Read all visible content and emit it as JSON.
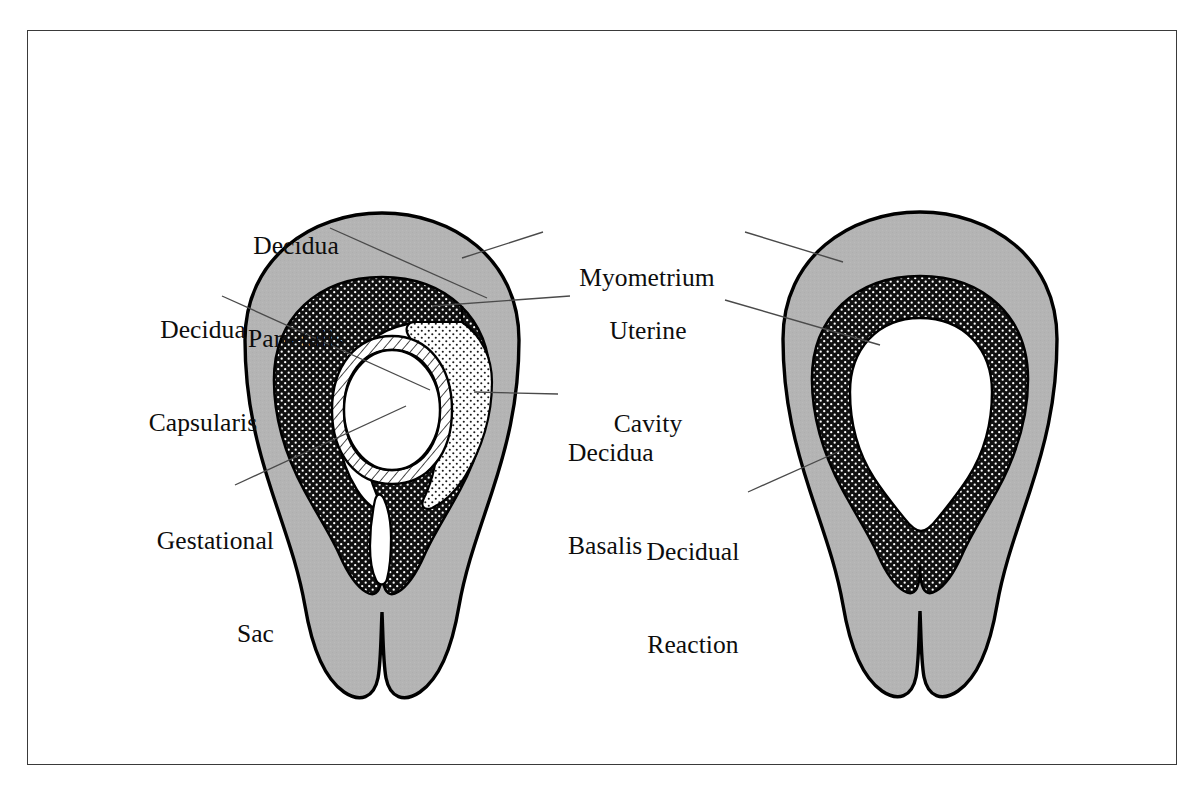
{
  "figure": {
    "frame": {
      "border_color": "#3a3a3a",
      "background": "#ffffff"
    }
  },
  "palette": {
    "myometrium_gray": "#b4b4b4",
    "decidua_black": "#101010",
    "cavity_white": "#ffffff",
    "outline_black": "#000000",
    "leader_line": "#4a4a4a",
    "text_black": "#0d0d0d"
  },
  "labels": [
    {
      "id": "decidua-parietalis",
      "lines": [
        "Decidua",
        "Parietalis"
      ],
      "align": "center",
      "x": 206,
      "y": 168,
      "width": 180,
      "leader": [
        [
          330,
          228
        ],
        [
          487,
          298
        ]
      ]
    },
    {
      "id": "decidua-capsularis",
      "lines": [
        "Decidua",
        "Capsularis"
      ],
      "align": "center",
      "x": 108,
      "y": 252,
      "width": 190,
      "leader": [
        [
          222,
          296
        ],
        [
          430,
          390
        ]
      ]
    },
    {
      "id": "gestational-sac",
      "lines": [
        "Gestational",
        "Sac"
      ],
      "align": "right",
      "x": 92,
      "y": 463,
      "width": 182,
      "leader": [
        [
          235,
          485
        ],
        [
          406,
          406
        ]
      ]
    },
    {
      "id": "myometrium",
      "lines": [
        "Myometrium"
      ],
      "align": "center",
      "x": 553,
      "y": 200,
      "width": 188,
      "leader_left": [
        [
          543,
          232
        ],
        [
          462,
          258
        ]
      ],
      "leader_right": [
        [
          745,
          232
        ],
        [
          843,
          262
        ]
      ]
    },
    {
      "id": "uterine-cavity",
      "lines": [
        "Uterine",
        "Cavity"
      ],
      "align": "center",
      "x": 576,
      "y": 253,
      "width": 144,
      "leader_left": [
        [
          570,
          296
        ],
        [
          432,
          306
        ]
      ],
      "leader_right": [
        [
          725,
          300
        ],
        [
          880,
          345
        ]
      ]
    },
    {
      "id": "decidua-basalis",
      "lines": [
        "Decidua",
        "Basalis"
      ],
      "align": "left",
      "x": 568,
      "y": 375,
      "width": 180,
      "leader": [
        [
          558,
          394
        ],
        [
          474,
          392
        ]
      ]
    },
    {
      "id": "decidual-reaction",
      "lines": [
        "Decidual",
        "Reaction"
      ],
      "align": "center",
      "x": 600,
      "y": 474,
      "width": 186,
      "leader": [
        [
          748,
          492
        ],
        [
          842,
          450
        ]
      ]
    }
  ],
  "diagrams": [
    {
      "id": "left-uterus",
      "caption_key": "early-gestational-sac",
      "center_x": 382,
      "layers": [
        {
          "name": "myometrium",
          "fill": "myometrium_gray",
          "label_ref": "myometrium"
        },
        {
          "name": "decidua-parietalis",
          "fill": "decidua_black",
          "label_ref": "decidua-parietalis"
        },
        {
          "name": "decidua-capsularis",
          "fill": "decidua_black",
          "label_ref": "decidua-capsularis"
        },
        {
          "name": "uterine-cavity",
          "fill": "cavity_white",
          "label_ref": "uterine-cavity"
        },
        {
          "name": "gestational-sac",
          "fill": "hatch",
          "label_ref": "gestational-sac"
        },
        {
          "name": "decidua-basalis",
          "fill": "fine-stipple",
          "label_ref": "decidua-basalis"
        }
      ]
    },
    {
      "id": "right-uterus",
      "center_x": 920,
      "layers": [
        {
          "name": "myometrium",
          "fill": "myometrium_gray",
          "label_ref": "myometrium"
        },
        {
          "name": "decidual-reaction",
          "fill": "decidua_black",
          "label_ref": "decidual-reaction"
        },
        {
          "name": "uterine-cavity",
          "fill": "cavity_white",
          "label_ref": "uterine-cavity"
        }
      ]
    }
  ]
}
